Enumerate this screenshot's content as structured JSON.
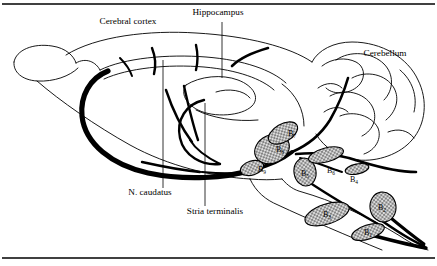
{
  "figure": {
    "title_visible": false,
    "frame": {
      "rule_color": "#000000",
      "background": "#ffffff"
    },
    "colors": {
      "outline": "#000000",
      "tract": "#000000",
      "nucleus_fill": "#d8d8d8",
      "nucleus_stipple": "#000000",
      "background": "#ffffff"
    },
    "annotations": [
      {
        "id": "cerebral-cortex",
        "label": "Cerebral cortex",
        "x": 128,
        "y": 24,
        "anchor": "middle",
        "has_leader": false
      },
      {
        "id": "hippocampus",
        "label": "Hippocampus",
        "x": 218,
        "y": 15,
        "anchor": "middle",
        "has_leader": true
      },
      {
        "id": "cerebellum",
        "label": "Cerebellum",
        "x": 385,
        "y": 56,
        "anchor": "middle",
        "has_leader": false
      },
      {
        "id": "n-caudatus",
        "label": "N. caudatus",
        "x": 150,
        "y": 195,
        "anchor": "middle",
        "has_leader": true
      },
      {
        "id": "stria-terminalis",
        "label": "Stria terminalis",
        "x": 215,
        "y": 214,
        "anchor": "middle",
        "has_leader": true
      }
    ],
    "nuclei": [
      {
        "id": "b9",
        "base": "B",
        "sub": "9",
        "label_x": 258,
        "label_y": 172,
        "cx": 252,
        "cy": 168,
        "rx": 12,
        "ry": 7,
        "rot": -18
      },
      {
        "id": "b8",
        "base": "B",
        "sub": "8",
        "label_x": 276,
        "label_y": 152,
        "cx": 272,
        "cy": 149,
        "rx": 18,
        "ry": 14,
        "rot": -25
      },
      {
        "id": "b7",
        "base": "B",
        "sub": "7",
        "label_x": 288,
        "label_y": 136,
        "cx": 283,
        "cy": 133,
        "rx": 16,
        "ry": 9,
        "rot": -30
      },
      {
        "id": "b5",
        "base": "B",
        "sub": "5",
        "label_x": 306,
        "label_y": 176,
        "cx": 305,
        "cy": 172,
        "rx": 11,
        "ry": 14,
        "rot": -10
      },
      {
        "id": "b6",
        "base": "B",
        "sub": "6",
        "label_x": 330,
        "label_y": 171,
        "cx": 326,
        "cy": 155,
        "rx": 18,
        "ry": 7,
        "rot": -15
      },
      {
        "id": "b4",
        "base": "B",
        "sub": "4",
        "label_x": 353,
        "label_y": 181,
        "cx": 357,
        "cy": 169,
        "rx": 12,
        "ry": 5,
        "rot": -12
      },
      {
        "id": "b3",
        "base": "B",
        "sub": "3",
        "label_x": 328,
        "label_y": 217,
        "cx": 327,
        "cy": 214,
        "rx": 23,
        "ry": 10,
        "rot": -18
      },
      {
        "id": "b2",
        "base": "B",
        "sub": "2",
        "label_x": 386,
        "label_y": 209,
        "cx": 383,
        "cy": 207,
        "rx": 13,
        "ry": 15,
        "rot": -8
      },
      {
        "id": "b1",
        "base": "B",
        "sub": "1",
        "label_x": 373,
        "label_y": 234,
        "cx": 368,
        "cy": 232,
        "rx": 17,
        "ry": 7,
        "rot": -18
      }
    ]
  }
}
